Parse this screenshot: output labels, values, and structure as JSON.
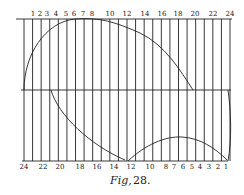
{
  "figure": {
    "caption_label": "Fig,",
    "caption_number": "28."
  },
  "top_scale": {
    "labels": [
      "1",
      "2",
      "3",
      "4",
      "5",
      "6",
      "7",
      "8",
      "10",
      "12",
      "14",
      "16",
      "18",
      "20",
      "22",
      "24"
    ]
  },
  "bottom_scale": {
    "labels": [
      "24",
      "22",
      "20",
      "18",
      "16",
      "14",
      "12",
      "10",
      "8",
      "7",
      "6",
      "5",
      "4",
      "3",
      "2",
      "1"
    ]
  },
  "colors": {
    "ink": "#222222",
    "paper": "#ffffff"
  }
}
